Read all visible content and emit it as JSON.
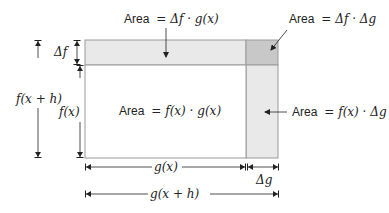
{
  "diagram": {
    "colors": {
      "strip": "#e9e9e9",
      "corner": "#c8c8c8",
      "outline": "#9a9a9a",
      "arrow": "#222222"
    },
    "areas": {
      "top_strip": {
        "word": "Area",
        "formula": "= Δf · g(x)"
      },
      "corner": {
        "word": "Area",
        "formula": "= Δf · Δg"
      },
      "main": {
        "word": "Area",
        "formula": "= f(x) · g(x)"
      },
      "right_strip": {
        "word": "Area",
        "formula": "= f(x) · Δg"
      }
    },
    "dimensions": {
      "delta_f": "Δf",
      "f_x": "f(x)",
      "f_x_plus_h": "f(x + h)",
      "g_x": "g(x)",
      "delta_g": "Δg",
      "g_x_plus_h": "g(x + h)"
    }
  }
}
